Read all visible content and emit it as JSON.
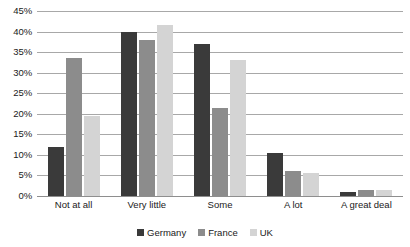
{
  "chart_data": {
    "type": "bar",
    "title": "",
    "subtitle": "",
    "xlabel": "",
    "ylabel": "",
    "ylim": [
      0,
      45
    ],
    "ytick_step": 5,
    "ytick_labels": [
      "45%",
      "40%",
      "35%",
      "30%",
      "25%",
      "20%",
      "15%",
      "10%",
      "5%",
      "0%"
    ],
    "ytick_values": [
      45,
      40,
      35,
      30,
      25,
      20,
      15,
      10,
      5,
      0
    ],
    "grid": true,
    "legend_position": "bottom",
    "categories": [
      "Not at all",
      "Very little",
      "Some",
      "A lot",
      "A great deal"
    ],
    "series": [
      {
        "name": "Germany",
        "color": "#3a3a3a",
        "values": [
          12,
          40,
          37,
          10.5,
          1
        ]
      },
      {
        "name": "France",
        "color": "#8c8c8c",
        "values": [
          33.5,
          38,
          21.5,
          6,
          1.5
        ]
      },
      {
        "name": "UK",
        "color": "#d4d4d4",
        "values": [
          19.5,
          41.5,
          33,
          5.5,
          1.5
        ]
      }
    ]
  },
  "axis": {
    "gridline_color": "#a8a8a8",
    "baseline_color": "#8e8e8e"
  }
}
